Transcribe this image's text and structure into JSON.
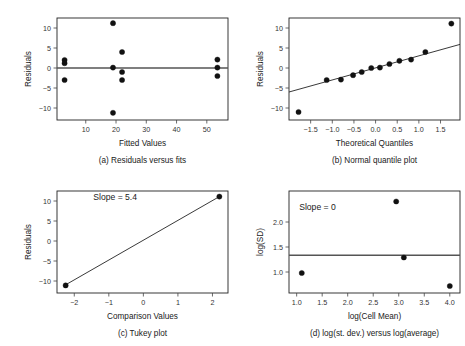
{
  "figure": {
    "caption_a": "(a) Residuals versus fits",
    "caption_b": "(b) Normal quantile plot",
    "caption_c": "(c) Tukey plot",
    "caption_d": "(d) log(st. dev.) versus log(average)"
  },
  "chart_data": [
    {
      "id": "a",
      "type": "scatter",
      "title": "(a) Residuals versus fits",
      "xlabel": "Fitted Values",
      "ylabel": "Residuals",
      "xlim": [
        0.5,
        57
      ],
      "ylim": [
        -13,
        12.5
      ],
      "xticks": [
        10,
        20,
        30,
        40,
        50
      ],
      "xtick_labels": [
        "10",
        "20",
        "30",
        "40",
        "50"
      ],
      "yticks": [
        -10,
        -5,
        0,
        5,
        10
      ],
      "ytick_labels": [
        "-10",
        "-5",
        "0",
        "5",
        "10"
      ],
      "grid": false,
      "reference_line": {
        "type": "horizontal",
        "y": 0,
        "color": "#555555"
      },
      "points": [
        {
          "x": 3.0,
          "y": 2.0
        },
        {
          "x": 3.0,
          "y": 1.2
        },
        {
          "x": 3.0,
          "y": -3.0
        },
        {
          "x": 19.0,
          "y": 11.2
        },
        {
          "x": 19.0,
          "y": 0.1
        },
        {
          "x": 19.0,
          "y": -11.2
        },
        {
          "x": 22.0,
          "y": 4.0
        },
        {
          "x": 22.0,
          "y": -1.0
        },
        {
          "x": 22.0,
          "y": -3.0
        },
        {
          "x": 53.5,
          "y": 2.1
        },
        {
          "x": 53.5,
          "y": 0.1
        },
        {
          "x": 53.5,
          "y": -2.0
        }
      ]
    },
    {
      "id": "b",
      "type": "scatter",
      "title": "(b) Normal quantile plot",
      "xlabel": "Theoretical Quantiles",
      "ylabel": "Residuals",
      "xlim": [
        -2.0,
        1.95
      ],
      "ylim": [
        -13,
        12.5
      ],
      "xticks": [
        -1.5,
        -1.0,
        -0.5,
        0.0,
        0.5,
        1.0,
        1.5
      ],
      "xtick_labels": [
        "-1.5",
        "-1.0",
        "-0.5",
        "0.0",
        "0.5",
        "1.0",
        "1.5"
      ],
      "yticks": [
        -10,
        -5,
        0,
        5,
        10
      ],
      "ytick_labels": [
        "-10",
        "-5",
        "0",
        "5",
        "10"
      ],
      "grid": false,
      "fit_line": {
        "type": "linear",
        "x0": -2.0,
        "y0": -6.0,
        "x1": 1.95,
        "y1": 5.9,
        "color": "#222222"
      },
      "points": [
        {
          "x": -1.78,
          "y": -11.0
        },
        {
          "x": -1.13,
          "y": -3.0
        },
        {
          "x": -0.8,
          "y": -2.9
        },
        {
          "x": -0.52,
          "y": -1.8
        },
        {
          "x": -0.32,
          "y": -1.0
        },
        {
          "x": -0.1,
          "y": 0.0
        },
        {
          "x": 0.1,
          "y": 0.1
        },
        {
          "x": 0.32,
          "y": 1.0
        },
        {
          "x": 0.55,
          "y": 1.8
        },
        {
          "x": 0.82,
          "y": 2.1
        },
        {
          "x": 1.15,
          "y": 4.0
        },
        {
          "x": 1.75,
          "y": 11.1
        }
      ]
    },
    {
      "id": "c",
      "type": "scatter",
      "title": "(c) Tukey plot",
      "xlabel": "Comparison Values",
      "ylabel": "Residuals",
      "xlim": [
        -2.5,
        2.45
      ],
      "ylim": [
        -13,
        12.5
      ],
      "xticks": [
        -2,
        -1,
        0,
        1,
        2
      ],
      "xtick_labels": [
        "-2",
        "-1",
        "0",
        "1",
        "2"
      ],
      "yticks": [
        -10,
        -5,
        0,
        5,
        10
      ],
      "ytick_labels": [
        "-10",
        "-5",
        "0",
        "5",
        "10"
      ],
      "grid": false,
      "annotation": "Slope = 5.4",
      "annotation_x": -1.45,
      "annotation_y": 10.2,
      "slope": 5.4,
      "fit_line": {
        "type": "linear",
        "x0": -2.3,
        "y0": -11.2,
        "x1": 2.22,
        "y1": 11.2,
        "color": "#222222"
      },
      "points": [
        {
          "x": -2.25,
          "y": -11.1
        },
        {
          "x": 2.2,
          "y": 11.1
        }
      ]
    },
    {
      "id": "d",
      "type": "scatter",
      "title": "(d) log(st. dev.) versus log(average)",
      "xlabel": "log(Cell Mean)",
      "ylabel": "log(SD)",
      "xlim": [
        0.85,
        4.2
      ],
      "ylim": [
        0.58,
        2.62
      ],
      "xticks": [
        1.0,
        1.5,
        2.0,
        2.5,
        3.0,
        3.5,
        4.0
      ],
      "xtick_labels": [
        "1.0",
        "1.5",
        "2.0",
        "2.5",
        "3.0",
        "3.5",
        "4.0"
      ],
      "yticks": [
        1.0,
        1.5,
        2.0
      ],
      "ytick_labels": [
        "1.0",
        "1.5",
        "2.0"
      ],
      "grid": false,
      "annotation": "Slope = 0",
      "annotation_x": 1.05,
      "annotation_y": 2.24,
      "slope": 0,
      "reference_line": {
        "type": "horizontal",
        "y": 1.335,
        "color": "#555555"
      },
      "points": [
        {
          "x": 1.1,
          "y": 0.98
        },
        {
          "x": 2.95,
          "y": 2.41
        },
        {
          "x": 3.1,
          "y": 1.29
        },
        {
          "x": 4.0,
          "y": 0.72
        }
      ]
    }
  ]
}
